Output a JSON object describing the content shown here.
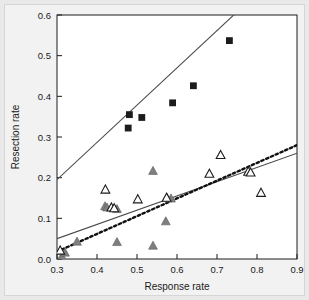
{
  "chart_data": {
    "type": "scatter",
    "title": "",
    "xlabel": "Response rate",
    "ylabel": "Resection rate",
    "xlim": [
      0.3,
      0.9
    ],
    "ylim": [
      0.0,
      0.6
    ],
    "xticks": [
      "0.3",
      "0.4",
      "0.5",
      "0.6",
      "0.7",
      "0.8",
      "0.9"
    ],
    "yticks": [
      "0.0",
      "0.1",
      "0.2",
      "0.3",
      "0.4",
      "0.5",
      "0.6"
    ],
    "grid": false,
    "legend": "none",
    "series": [
      {
        "name": "filled-square",
        "marker": "filled-square",
        "color": "#1c1c1c",
        "points": [
          [
            0.478,
            0.322
          ],
          [
            0.481,
            0.355
          ],
          [
            0.512,
            0.348
          ],
          [
            0.589,
            0.384
          ],
          [
            0.641,
            0.426
          ],
          [
            0.731,
            0.537
          ]
        ]
      },
      {
        "name": "filled-triangle",
        "marker": "filled-triangle",
        "color": "#7f7f7f",
        "points": [
          [
            0.312,
            0.008
          ],
          [
            0.32,
            0.017
          ],
          [
            0.35,
            0.044
          ],
          [
            0.42,
            0.131
          ],
          [
            0.425,
            0.128
          ],
          [
            0.45,
            0.124
          ],
          [
            0.45,
            0.043
          ],
          [
            0.54,
            0.218
          ],
          [
            0.54,
            0.034
          ],
          [
            0.572,
            0.094
          ],
          [
            0.575,
            0.152
          ],
          [
            0.585,
            0.15
          ]
        ]
      },
      {
        "name": "open-triangle",
        "marker": "open-triangle",
        "color": "#1c1c1c",
        "points": [
          [
            0.308,
            0.022
          ],
          [
            0.421,
            0.172
          ],
          [
            0.436,
            0.128
          ],
          [
            0.443,
            0.126
          ],
          [
            0.502,
            0.148
          ],
          [
            0.574,
            0.152
          ],
          [
            0.681,
            0.211
          ],
          [
            0.709,
            0.257
          ],
          [
            0.778,
            0.216
          ],
          [
            0.784,
            0.214
          ],
          [
            0.81,
            0.164
          ]
        ]
      }
    ],
    "lines": [
      {
        "name": "upper-solid-regression",
        "style": "solid",
        "color": "#4a4a4a",
        "x0": 0.3,
        "y0": 0.195,
        "x1": 0.9,
        "y1": 0.745
      },
      {
        "name": "lower-solid-regression",
        "style": "solid",
        "color": "#4a4a4a",
        "x0": 0.3,
        "y0": 0.05,
        "x1": 0.9,
        "y1": 0.26
      },
      {
        "name": "lower-dotted-regression",
        "style": "dotted",
        "color": "#111111",
        "x0": 0.3,
        "y0": 0.018,
        "x1": 0.9,
        "y1": 0.28
      }
    ]
  }
}
